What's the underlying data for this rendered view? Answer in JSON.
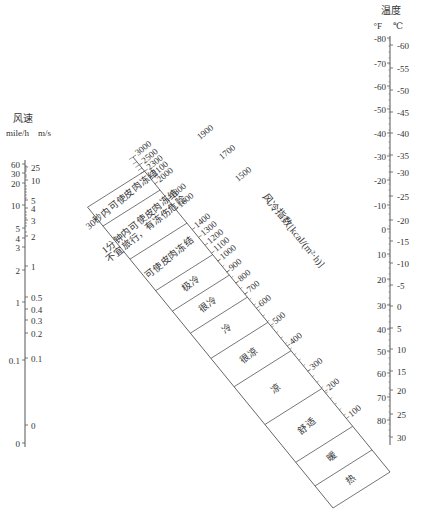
{
  "wind_speed_axis": {
    "title": "风速",
    "unit_left": "mile/h",
    "unit_right": "m/s",
    "left_ticks": [
      {
        "label": "60",
        "y": 164
      },
      {
        "label": "30",
        "y": 173
      },
      {
        "label": "20",
        "y": 183
      },
      {
        "label": "10",
        "y": 205
      },
      {
        "label": "5",
        "y": 228
      },
      {
        "label": "4",
        "y": 238
      },
      {
        "label": "3",
        "y": 247
      },
      {
        "label": "2",
        "y": 270
      },
      {
        "label": "1",
        "y": 302
      },
      {
        "label": "0.1",
        "y": 360
      },
      {
        "label": "0",
        "y": 443
      }
    ],
    "right_ticks": [
      {
        "label": "25",
        "y": 167
      },
      {
        "label": "10",
        "y": 180
      },
      {
        "label": "5",
        "y": 200
      },
      {
        "label": "4",
        "y": 208
      },
      {
        "label": "3",
        "y": 220
      },
      {
        "label": "2",
        "y": 236
      },
      {
        "label": "1",
        "y": 266
      },
      {
        "label": "0.5",
        "y": 297
      },
      {
        "label": "0.4",
        "y": 309
      },
      {
        "label": "0.3",
        "y": 320
      },
      {
        "label": "0.2",
        "y": 333
      },
      {
        "label": "0.1",
        "y": 358
      },
      {
        "label": "0",
        "y": 425
      }
    ]
  },
  "temperature_axis": {
    "title": "温度",
    "unit_f": "°F",
    "unit_c": "℃",
    "f_ticks": [
      {
        "label": "-80",
        "y": 38
      },
      {
        "label": "-70",
        "y": 63
      },
      {
        "label": "-60",
        "y": 86
      },
      {
        "label": "-50",
        "y": 109
      },
      {
        "label": "-40",
        "y": 133
      },
      {
        "label": "-30",
        "y": 156
      },
      {
        "label": "-20",
        "y": 180
      },
      {
        "label": "-10",
        "y": 205
      },
      {
        "label": "0",
        "y": 229
      },
      {
        "label": "10",
        "y": 254
      },
      {
        "label": "20",
        "y": 279
      },
      {
        "label": "30",
        "y": 305
      },
      {
        "label": "40",
        "y": 329
      },
      {
        "label": "50",
        "y": 351
      },
      {
        "label": "60",
        "y": 373
      },
      {
        "label": "70",
        "y": 397
      },
      {
        "label": "80",
        "y": 420
      }
    ],
    "c_ticks": [
      {
        "label": "-60",
        "y": 45
      },
      {
        "label": "-55",
        "y": 68
      },
      {
        "label": "-50",
        "y": 90
      },
      {
        "label": "-45",
        "y": 112
      },
      {
        "label": "-40",
        "y": 133
      },
      {
        "label": "-35",
        "y": 155
      },
      {
        "label": "-30",
        "y": 172
      },
      {
        "label": "-25",
        "y": 196
      },
      {
        "label": "-20",
        "y": 220
      },
      {
        "label": "-15",
        "y": 241
      },
      {
        "label": "-10",
        "y": 263
      },
      {
        "label": "-5",
        "y": 285
      },
      {
        "label": "0",
        "y": 306
      },
      {
        "label": "5",
        "y": 328
      },
      {
        "label": "10",
        "y": 349
      },
      {
        "label": "15",
        "y": 371
      },
      {
        "label": "20",
        "y": 390
      },
      {
        "label": "25",
        "y": 414
      },
      {
        "label": "30",
        "y": 437
      }
    ]
  },
  "wind_chill_axis": {
    "title": "风冷指数[kcal/(m²·h)]",
    "ticks": [
      {
        "label": "3000",
        "t": 0.0
      },
      {
        "label": "2500",
        "t": 0.025
      },
      {
        "label": "2300",
        "t": 0.045
      },
      {
        "label": "2100",
        "t": 0.065
      },
      {
        "label": "2000",
        "t": 0.085
      },
      {
        "label": "1800",
        "t": 0.135
      },
      {
        "label": "1600",
        "t": 0.165
      },
      {
        "label": "1400",
        "t": 0.23
      },
      {
        "label": "1300",
        "t": 0.255
      },
      {
        "label": "1200",
        "t": 0.28
      },
      {
        "label": "1100",
        "t": 0.305
      },
      {
        "label": "1000",
        "t": 0.33
      },
      {
        "label": "900",
        "t": 0.365
      },
      {
        "label": "800",
        "t": 0.4
      },
      {
        "label": "700",
        "t": 0.435
      },
      {
        "label": "600",
        "t": 0.48
      },
      {
        "label": "500",
        "t": 0.535
      },
      {
        "label": "400",
        "t": 0.6
      },
      {
        "label": "300",
        "t": 0.68
      },
      {
        "label": "200",
        "t": 0.745
      },
      {
        "label": "100",
        "t": 0.83
      }
    ],
    "side_ticks": [
      {
        "label": "1900",
        "x": 200,
        "y": 140
      },
      {
        "label": "1700",
        "x": 222,
        "y": 160
      },
      {
        "label": "1500",
        "x": 238,
        "y": 182
      }
    ]
  },
  "zones": [
    {
      "label": "30秒内可使皮肉冻结",
      "t0": 0.045,
      "t1": 0.105
    },
    {
      "label": "1分钟内可使皮肉冻结",
      "label2": "不宜旅行，有冻伤危险",
      "t0": 0.105,
      "t1": 0.21
    },
    {
      "label": "可使皮肉冻结",
      "t0": 0.21,
      "t1": 0.31
    },
    {
      "label": "极冷",
      "t0": 0.31,
      "t1": 0.375
    },
    {
      "label": "很冷",
      "t0": 0.375,
      "t1": 0.445
    },
    {
      "label": "冷",
      "t0": 0.445,
      "t1": 0.525
    },
    {
      "label": "很凉",
      "t0": 0.525,
      "t1": 0.615
    },
    {
      "label": "凉",
      "t0": 0.615,
      "t1": 0.735
    },
    {
      "label": "舒适",
      "t0": 0.735,
      "t1": 0.855
    },
    {
      "label": "暖",
      "t0": 0.855,
      "t1": 0.93
    },
    {
      "label": "热",
      "t0": 0.93,
      "t1": 1.0
    }
  ],
  "colors": {
    "line": "#555555",
    "text": "#333333",
    "background": "#ffffff"
  }
}
